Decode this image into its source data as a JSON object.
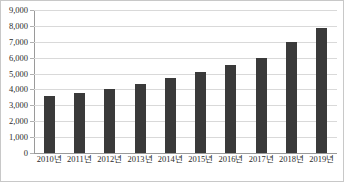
{
  "chart_data": {
    "type": "bar",
    "title": "",
    "xlabel": "",
    "ylabel": "",
    "categories": [
      "2010년",
      "2011년",
      "2012년",
      "2013년",
      "2014년",
      "2015년",
      "2016년",
      "2017년",
      "2018년",
      "2019년"
    ],
    "values": [
      3580,
      3790,
      4060,
      4340,
      4690,
      5080,
      5530,
      6000,
      7010,
      7850
    ],
    "ylim": [
      0,
      9000
    ],
    "ytick_values": [
      0,
      1000,
      2000,
      3000,
      4000,
      5000,
      6000,
      7000,
      8000,
      9000
    ],
    "ytick_labels": [
      "0",
      "1,000",
      "2,000",
      "3,000",
      "4,000",
      "5,000",
      "6,000",
      "7,000",
      "8,000",
      "9,000"
    ],
    "grid": true,
    "legend": false,
    "legend_position": "none",
    "series": [
      {
        "name": "",
        "values": [
          3580,
          3790,
          4060,
          4340,
          4690,
          5080,
          5530,
          6000,
          7010,
          7850
        ]
      }
    ],
    "colors": {
      "bar": "#3a3a3a",
      "gridline": "#d9d9d9",
      "axis": "#9a9a9a",
      "text": "#2b2b2b",
      "background": "#ffffff",
      "border": "#c8c8c8"
    }
  }
}
